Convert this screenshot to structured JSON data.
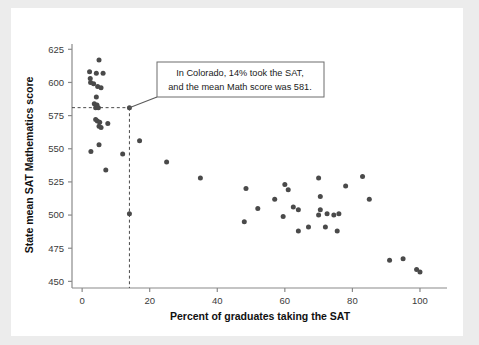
{
  "chart_data": {
    "type": "scatter",
    "title": "",
    "xlabel": "Percent of graduates taking the SAT",
    "ylabel": "State mean SAT Mathematics score",
    "xlim": [
      -3,
      108
    ],
    "ylim": [
      445,
      629
    ],
    "xticks": [
      0,
      20,
      40,
      60,
      80,
      100
    ],
    "xtick_labels": [
      "0",
      "20",
      "40",
      "60",
      "80",
      "100"
    ],
    "yticks": [
      450,
      475,
      500,
      525,
      550,
      575,
      600,
      625
    ],
    "ytick_labels": [
      "450",
      "475",
      "500",
      "525",
      "550",
      "575",
      "600",
      "625"
    ],
    "grid": false,
    "legend": "none",
    "marker_color": "#4a4a4a",
    "points": [
      {
        "x": 5.0,
        "y": 617
      },
      {
        "x": 2.2,
        "y": 608
      },
      {
        "x": 4.2,
        "y": 607
      },
      {
        "x": 6.2,
        "y": 607
      },
      {
        "x": 2.4,
        "y": 603
      },
      {
        "x": 2.5,
        "y": 600
      },
      {
        "x": 3.4,
        "y": 599
      },
      {
        "x": 4.6,
        "y": 597
      },
      {
        "x": 5.6,
        "y": 596
      },
      {
        "x": 4.2,
        "y": 589
      },
      {
        "x": 3.6,
        "y": 584
      },
      {
        "x": 4.4,
        "y": 583
      },
      {
        "x": 4.0,
        "y": 581
      },
      {
        "x": 4.8,
        "y": 581
      },
      {
        "x": 14.0,
        "y": 581
      },
      {
        "x": 4.0,
        "y": 572
      },
      {
        "x": 4.5,
        "y": 571
      },
      {
        "x": 5.2,
        "y": 570
      },
      {
        "x": 7.6,
        "y": 569
      },
      {
        "x": 5.0,
        "y": 567
      },
      {
        "x": 5.6,
        "y": 566
      },
      {
        "x": 17.0,
        "y": 556
      },
      {
        "x": 5.0,
        "y": 553
      },
      {
        "x": 2.6,
        "y": 548
      },
      {
        "x": 12.0,
        "y": 546
      },
      {
        "x": 25.0,
        "y": 540
      },
      {
        "x": 7.0,
        "y": 534
      },
      {
        "x": 35.0,
        "y": 528
      },
      {
        "x": 70.0,
        "y": 528
      },
      {
        "x": 83.0,
        "y": 529
      },
      {
        "x": 60.0,
        "y": 523
      },
      {
        "x": 78.0,
        "y": 522
      },
      {
        "x": 48.5,
        "y": 520
      },
      {
        "x": 61.0,
        "y": 519
      },
      {
        "x": 70.5,
        "y": 514
      },
      {
        "x": 85.0,
        "y": 512
      },
      {
        "x": 57.0,
        "y": 512
      },
      {
        "x": 62.5,
        "y": 506
      },
      {
        "x": 52.0,
        "y": 505
      },
      {
        "x": 64.0,
        "y": 504
      },
      {
        "x": 70.5,
        "y": 504
      },
      {
        "x": 14.0,
        "y": 501
      },
      {
        "x": 76.0,
        "y": 501
      },
      {
        "x": 72.5,
        "y": 501
      },
      {
        "x": 70.0,
        "y": 500
      },
      {
        "x": 74.5,
        "y": 500
      },
      {
        "x": 59.5,
        "y": 499
      },
      {
        "x": 48.0,
        "y": 495
      },
      {
        "x": 67.0,
        "y": 491
      },
      {
        "x": 72.0,
        "y": 491
      },
      {
        "x": 64.0,
        "y": 488
      },
      {
        "x": 75.5,
        "y": 488
      },
      {
        "x": 91.0,
        "y": 466
      },
      {
        "x": 95.0,
        "y": 467
      },
      {
        "x": 99.0,
        "y": 459
      },
      {
        "x": 100.0,
        "y": 457
      }
    ],
    "annotation": {
      "line1": "In Colorado, 14% took the SAT,",
      "line2": "and the mean Math score was 581.",
      "target_x": 14,
      "target_y": 581,
      "guide_lines": "dashed"
    }
  }
}
